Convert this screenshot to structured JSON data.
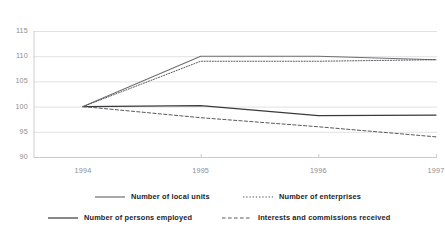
{
  "chart_data": {
    "type": "line",
    "title": "",
    "subtitle": "",
    "xlabel": "",
    "ylabel": "",
    "categories": [
      "1994",
      "1995",
      "1996",
      "1997"
    ],
    "x": [
      1994,
      1995,
      1996,
      1997
    ],
    "xlim": [
      1994,
      1997
    ],
    "ylim": [
      90,
      115
    ],
    "yticks": [
      90,
      95,
      100,
      105,
      110,
      115
    ],
    "ytick_labels": [
      "90",
      "95",
      "100",
      "105",
      "110",
      "115"
    ],
    "xtick_labels": [
      "1994",
      "1995",
      "1996",
      "1997"
    ],
    "grid": "horizontal",
    "legend_position": "bottom",
    "index_base": 100,
    "series": [
      {
        "name": "Number of local units",
        "values": [
          100,
          110,
          110,
          109.3
        ],
        "style": "solid",
        "color": "#6f6f72",
        "width": 1.1
      },
      {
        "name": "Number of enterprises",
        "values": [
          100,
          109,
          109,
          109.3
        ],
        "style": "dotted",
        "color": "#5a5a5d",
        "width": 1.0
      },
      {
        "name": "Number of persons employed",
        "values": [
          100,
          100.2,
          98.2,
          98.3
        ],
        "style": "solid",
        "color": "#3a3a3c",
        "width": 1.1
      },
      {
        "name": "Interests and commissions received",
        "values": [
          100,
          97.8,
          96,
          94
        ],
        "style": "dashed",
        "color": "#5a5a5d",
        "width": 1.0
      }
    ]
  },
  "axis": {
    "y_labels": [
      "115",
      "110",
      "105",
      "100",
      "95",
      "90"
    ],
    "x_labels": [
      "1994",
      "1995",
      "1996",
      "1997"
    ]
  },
  "legend": {
    "entries": [
      {
        "label": "Number of local units",
        "style": "solid"
      },
      {
        "label": "Number of enterprises",
        "style": "dotted"
      },
      {
        "label": "Number of persons employed",
        "style": "solid"
      },
      {
        "label": "Interests and commissions received",
        "style": "dashed"
      }
    ]
  },
  "colors": {
    "grid": "#d9d9dc",
    "axis": "#c8c8cb",
    "tick_text": "#8d8d90",
    "legend_text": "#1d1d1f",
    "background": "#ffffff"
  }
}
